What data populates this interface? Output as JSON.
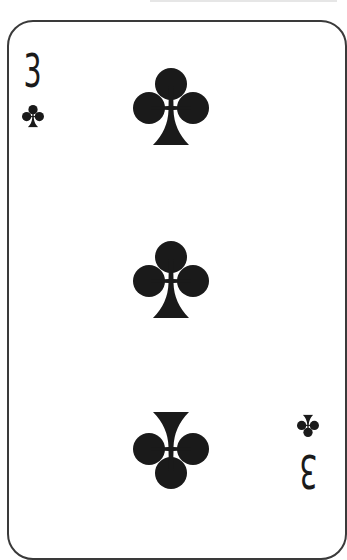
{
  "card": {
    "rank": "3",
    "suit": "clubs",
    "suit_icon": "club-icon",
    "pip_count": 3,
    "colors": {
      "ink": "#1a1a1a",
      "border": "#3a3a3a",
      "face": "#ffffff"
    }
  },
  "index_top_left": {
    "rank": "3"
  },
  "index_bottom_right": {
    "rank": "3"
  }
}
